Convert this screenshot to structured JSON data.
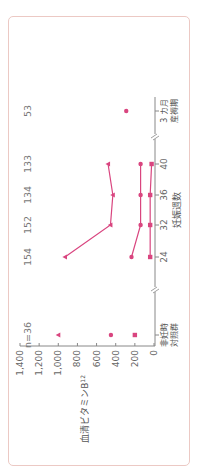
{
  "chart_data": {
    "type": "line",
    "orientation": "rotated-90-ccw",
    "title": "",
    "xlabel": "妊娠週数",
    "ylabel": "血清ビタミンB12",
    "ylabel_main": "血清ビタミン",
    "ylabel_sub_base": "B",
    "ylabel_sub": "12",
    "ylim": [
      0,
      1400
    ],
    "yticks": [
      0,
      200,
      400,
      600,
      800,
      1000,
      1200,
      1400
    ],
    "ytick_labels": [
      "0",
      "200",
      "400",
      "600",
      "800",
      "1,000",
      "1,200",
      "1,400"
    ],
    "categories": [
      "非妊時 対照群",
      "24",
      "32",
      "36",
      "40",
      "3カ月 産褥期"
    ],
    "category_lines": [
      [
        "非妊時",
        "対照群"
      ],
      [
        "24"
      ],
      [
        "32"
      ],
      [
        "36"
      ],
      [
        "40"
      ],
      [
        "3 カ月",
        "産褥期"
      ]
    ],
    "n_labels": [
      "n=36",
      "154",
      "152",
      "134",
      "133",
      "53"
    ],
    "axis_breaks_after_category_index": [
      0,
      4
    ],
    "grid": false,
    "series": [
      {
        "name": "triangle-series",
        "marker": "triangle",
        "values": [
          1000,
          930,
          455,
          430,
          480,
          null
        ],
        "connect_indices": [
          1,
          2,
          3,
          4
        ]
      },
      {
        "name": "circle-series",
        "marker": "circle",
        "values": [
          450,
          235,
          140,
          140,
          140,
          290
        ],
        "connect_indices": [
          1,
          2,
          3,
          4
        ]
      },
      {
        "name": "square-series",
        "marker": "square",
        "values": [
          200,
          40,
          40,
          40,
          25,
          null
        ],
        "connect_indices": [
          1,
          2,
          3,
          4
        ]
      }
    ],
    "colors": {
      "series": "#d9457f",
      "axis": "#888888",
      "frame": "#ecc9c4"
    }
  }
}
